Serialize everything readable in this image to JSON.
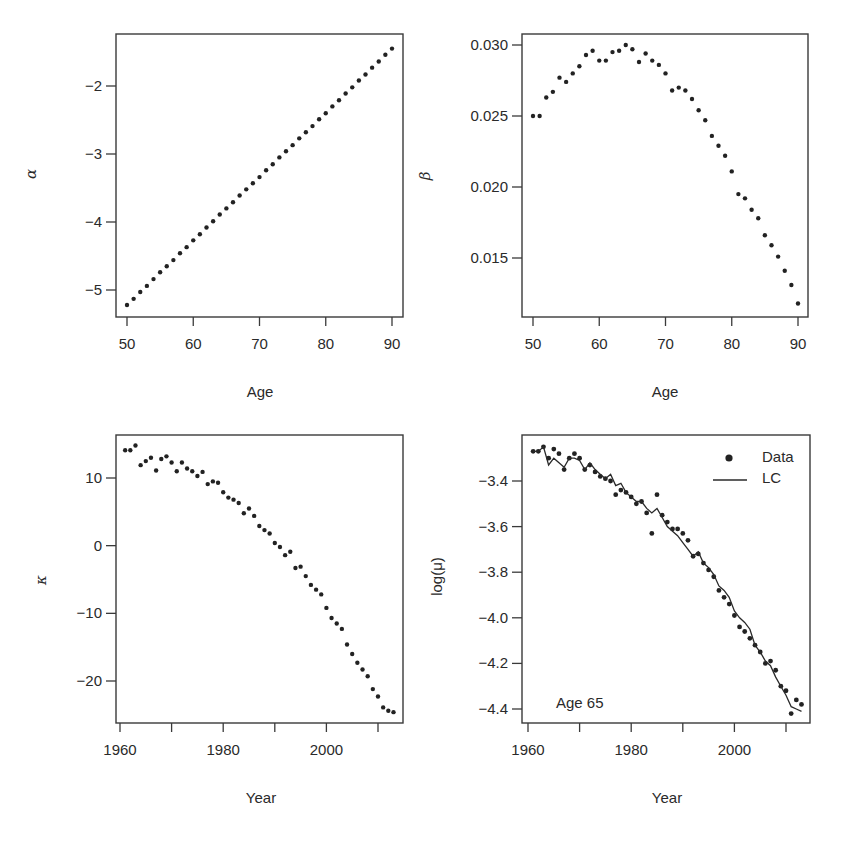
{
  "chart_data": [
    {
      "id": "alpha",
      "type": "scatter",
      "title": "",
      "xlabel": "Age",
      "ylabel": "α",
      "xlim": [
        48.5,
        91.7
      ],
      "ylim": [
        -5.4,
        -1.2
      ],
      "xticks": [
        50,
        60,
        70,
        80,
        90
      ],
      "yticks": [
        -5,
        -4,
        -3,
        -2
      ],
      "ytick_labels": [
        "−5",
        "−4",
        "−3",
        "−2"
      ],
      "x": [
        50,
        51,
        52,
        53,
        54,
        55,
        56,
        57,
        58,
        59,
        60,
        61,
        62,
        63,
        64,
        65,
        66,
        67,
        68,
        69,
        70,
        71,
        72,
        73,
        74,
        75,
        76,
        77,
        78,
        79,
        80,
        81,
        82,
        83,
        84,
        85,
        86,
        87,
        88,
        89,
        90
      ],
      "values": [
        -5.22,
        -5.13,
        -5.03,
        -4.94,
        -4.84,
        -4.74,
        -4.65,
        -4.56,
        -4.46,
        -4.37,
        -4.27,
        -4.18,
        -4.08,
        -3.99,
        -3.89,
        -3.8,
        -3.71,
        -3.61,
        -3.52,
        -3.43,
        -3.34,
        -3.24,
        -3.15,
        -3.05,
        -2.96,
        -2.87,
        -2.77,
        -2.68,
        -2.59,
        -2.49,
        -2.4,
        -2.3,
        -2.21,
        -2.11,
        -2.02,
        -1.92,
        -1.83,
        -1.73,
        -1.64,
        -1.54,
        -1.45
      ],
      "grid": false
    },
    {
      "id": "beta",
      "type": "scatter",
      "title": "",
      "xlabel": "Age",
      "ylabel": "β",
      "xlim": [
        48.5,
        91.7
      ],
      "ylim": [
        0.0112,
        0.0308
      ],
      "xticks": [
        50,
        60,
        70,
        80,
        90
      ],
      "yticks": [
        0.015,
        0.02,
        0.025,
        0.03
      ],
      "ytick_labels": [
        "0.015",
        "0.020",
        "0.025",
        "0.030"
      ],
      "x": [
        50,
        51,
        52,
        53,
        54,
        55,
        56,
        57,
        58,
        59,
        60,
        61,
        62,
        63,
        64,
        65,
        66,
        67,
        68,
        69,
        70,
        71,
        72,
        73,
        74,
        75,
        76,
        77,
        78,
        79,
        80,
        81,
        82,
        83,
        84,
        85,
        86,
        87,
        88,
        89,
        90
      ],
      "values": [
        0.025,
        0.025,
        0.0263,
        0.0267,
        0.0277,
        0.0274,
        0.028,
        0.0285,
        0.0293,
        0.0296,
        0.0289,
        0.0289,
        0.0295,
        0.0296,
        0.03,
        0.0297,
        0.0288,
        0.0294,
        0.0289,
        0.0286,
        0.028,
        0.0268,
        0.027,
        0.0268,
        0.0262,
        0.0254,
        0.0247,
        0.0236,
        0.0229,
        0.0222,
        0.0211,
        0.0195,
        0.0192,
        0.0184,
        0.0178,
        0.0166,
        0.0159,
        0.0151,
        0.0141,
        0.0131,
        0.0118
      ],
      "grid": false
    },
    {
      "id": "kappa",
      "type": "scatter",
      "title": "",
      "xlabel": "Year",
      "ylabel": "κ",
      "xlim": [
        1959.2,
        2015
      ],
      "ylim": [
        -26,
        16
      ],
      "xticks": [
        1960,
        1970,
        1980,
        1990,
        2000,
        2010
      ],
      "xtick_labels": [
        "1960",
        "",
        "1980",
        "",
        "2000",
        ""
      ],
      "yticks": [
        -20,
        -10,
        0,
        10
      ],
      "ytick_labels": [
        "−20",
        "−10",
        "0",
        "10"
      ],
      "x": [
        1961,
        1962,
        1963,
        1964,
        1965,
        1966,
        1967,
        1968,
        1969,
        1970,
        1971,
        1972,
        1973,
        1974,
        1975,
        1976,
        1977,
        1978,
        1979,
        1980,
        1981,
        1982,
        1983,
        1984,
        1985,
        1986,
        1987,
        1988,
        1989,
        1990,
        1991,
        1992,
        1993,
        1994,
        1995,
        1996,
        1997,
        1998,
        1999,
        2000,
        2001,
        2002,
        2003,
        2004,
        2005,
        2006,
        2007,
        2008,
        2009,
        2010,
        2011,
        2012,
        2013
      ],
      "values": [
        14.1,
        14.1,
        14.8,
        11.9,
        12.5,
        13.0,
        11.1,
        12.8,
        13.2,
        12.3,
        11.0,
        12.3,
        11.4,
        11.0,
        10.3,
        10.9,
        9.1,
        9.5,
        9.3,
        7.9,
        7.1,
        6.8,
        6.3,
        4.8,
        5.5,
        4.4,
        2.9,
        2.3,
        1.8,
        0.4,
        -0.2,
        -1.4,
        -0.9,
        -3.3,
        -3.1,
        -4.5,
        -5.8,
        -6.5,
        -7.2,
        -9.2,
        -10.7,
        -11.5,
        -12.3,
        -14.6,
        -16.0,
        -17.3,
        -18.3,
        -19.3,
        -21.2,
        -22.3,
        -23.9,
        -24.4,
        -24.6
      ],
      "grid": false
    },
    {
      "id": "logmu",
      "type": "line+scatter",
      "title": "",
      "xlabel": "Year",
      "ylabel": "log(μ)",
      "xlim": [
        1959.2,
        2015
      ],
      "ylim": [
        -4.46,
        -3.23
      ],
      "xticks": [
        1960,
        1970,
        1980,
        1990,
        2000,
        2010
      ],
      "xtick_labels": [
        "1960",
        "",
        "1980",
        "",
        "2000",
        ""
      ],
      "yticks": [
        -4.4,
        -4.2,
        -4.0,
        -3.8,
        -3.6,
        -3.4
      ],
      "ytick_labels": [
        "−4.4",
        "−4.2",
        "−4.0",
        "−3.8",
        "−3.6",
        "−3.4"
      ],
      "annotation": "Age 65",
      "legend": {
        "position": "top-right",
        "entries": [
          "Data",
          "LC"
        ]
      },
      "x": [
        1961,
        1962,
        1963,
        1964,
        1965,
        1966,
        1967,
        1968,
        1969,
        1970,
        1971,
        1972,
        1973,
        1974,
        1975,
        1976,
        1977,
        1978,
        1979,
        1980,
        1981,
        1982,
        1983,
        1984,
        1985,
        1986,
        1987,
        1988,
        1989,
        1990,
        1991,
        1992,
        1993,
        1994,
        1995,
        1996,
        1997,
        1998,
        1999,
        2000,
        2001,
        2002,
        2003,
        2004,
        2005,
        2006,
        2007,
        2008,
        2009,
        2010,
        2011,
        2012,
        2013
      ],
      "series": [
        {
          "name": "Data",
          "style": "points",
          "values": [
            -3.27,
            -3.27,
            -3.25,
            -3.3,
            -3.26,
            -3.28,
            -3.35,
            -3.3,
            -3.28,
            -3.3,
            -3.35,
            -3.33,
            -3.36,
            -3.38,
            -3.39,
            -3.4,
            -3.46,
            -3.44,
            -3.45,
            -3.47,
            -3.5,
            -3.49,
            -3.54,
            -3.63,
            -3.46,
            -3.55,
            -3.58,
            -3.61,
            -3.61,
            -3.63,
            -3.66,
            -3.73,
            -3.72,
            -3.76,
            -3.79,
            -3.82,
            -3.88,
            -3.91,
            -3.94,
            -3.99,
            -4.04,
            -4.06,
            -4.09,
            -4.12,
            -4.15,
            -4.2,
            -4.19,
            -4.23,
            -4.3,
            -4.32,
            -4.42,
            -4.36,
            -4.38
          ]
        },
        {
          "name": "LC",
          "style": "line",
          "values": [
            -3.27,
            -3.27,
            -3.25,
            -3.33,
            -3.3,
            -3.32,
            -3.34,
            -3.3,
            -3.3,
            -3.31,
            -3.35,
            -3.32,
            -3.35,
            -3.37,
            -3.39,
            -3.37,
            -3.42,
            -3.41,
            -3.45,
            -3.47,
            -3.49,
            -3.49,
            -3.52,
            -3.54,
            -3.52,
            -3.56,
            -3.6,
            -3.62,
            -3.64,
            -3.67,
            -3.7,
            -3.73,
            -3.71,
            -3.76,
            -3.78,
            -3.81,
            -3.86,
            -3.88,
            -3.91,
            -3.97,
            -4.0,
            -4.02,
            -4.05,
            -4.12,
            -4.15,
            -4.19,
            -4.21,
            -4.26,
            -4.3,
            -4.34,
            -4.39,
            -4.4,
            -4.41
          ]
        }
      ],
      "grid": false
    }
  ],
  "panels": {
    "alpha": {
      "xlabel": "Age",
      "ylabel": "α"
    },
    "beta": {
      "xlabel": "Age",
      "ylabel": "β"
    },
    "kappa": {
      "xlabel": "Year",
      "ylabel": "κ"
    },
    "logmu": {
      "xlabel": "Year",
      "ylabel": "log(μ)",
      "annotation": "Age 65",
      "legend_data": "Data",
      "legend_lc": "LC"
    }
  }
}
